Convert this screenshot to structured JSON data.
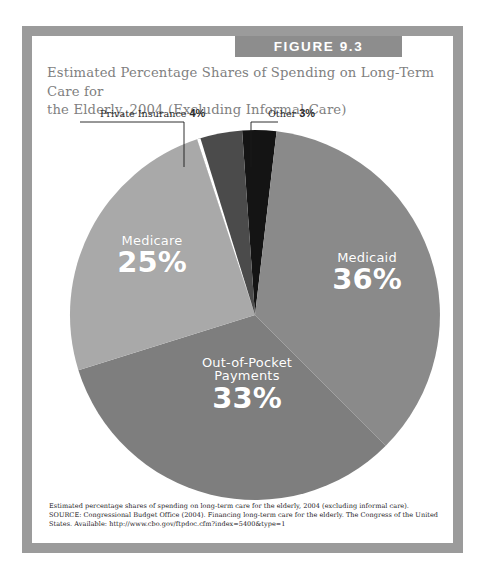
{
  "figure": {
    "banner_label": "FIGURE 9.3",
    "title_line1": "Estimated Percentage Shares of Spending on Long-Term Care for",
    "title_line2": "the Elderly, 2004 (Excluding Informal Care)",
    "caption_line1": "Estimated percentage shares of spending on long-term care for the elderly, 2004 (excluding informal care).",
    "caption_line2": "SOURCE: Congressional Budget Office (2004). Financing long-term care for the elderly. The Congress of the United",
    "caption_line3": "States. Available: http://www.cbo.gov/ftpdoc.cfm?index=5400&type=1"
  },
  "callouts": {
    "private_insurance_name": "Private Insurance",
    "private_insurance_value": "4%",
    "other_name": "Other",
    "other_value": "3%"
  },
  "slice_labels": {
    "medicaid_name": "Medicaid",
    "medicaid_value": "36%",
    "medicare_name": "Medicare",
    "medicare_value": "25%",
    "oop_name_line1": "Out-of-Pocket",
    "oop_name_line2": "Payments",
    "oop_value": "33%"
  },
  "colors": {
    "frame": "#9b9b9b",
    "banner": "#8d8d8d",
    "title_text": "#7f7f7f",
    "medicaid": "#8a8a8a",
    "out_of_pocket": "#7e7e7e",
    "medicare": "#a9a9a9",
    "private_insurance": "#4b4b4b",
    "other": "#141414",
    "label_text": "#ffffff",
    "leader_line": "#1a1a1a"
  },
  "chart_data": {
    "type": "pie",
    "title": "Estimated Percentage Shares of Spending on Long-Term Care for the Elderly, 2004 (Excluding Informal Care)",
    "xlabel": "",
    "ylabel": "",
    "legend_position": "none",
    "grid": false,
    "units": "percent",
    "total": 101,
    "start_angle_deg": -4,
    "direction": "clockwise",
    "labels": [
      "Other",
      "Medicaid",
      "Out-of-Pocket Payments",
      "Medicare",
      "Private Insurance"
    ],
    "values": [
      3,
      36,
      33,
      25,
      4
    ],
    "colors": [
      "#141414",
      "#8a8a8a",
      "#7e7e7e",
      "#a9a9a9",
      "#4b4b4b"
    ],
    "slices": [
      {
        "label": "Other",
        "value": 3,
        "display": "3%",
        "color": "#141414",
        "labeled_outside": true
      },
      {
        "label": "Medicaid",
        "value": 36,
        "display": "36%",
        "color": "#8a8a8a",
        "labeled_outside": false
      },
      {
        "label": "Out-of-Pocket Payments",
        "value": 33,
        "display": "33%",
        "color": "#7e7e7e",
        "labeled_outside": false
      },
      {
        "label": "Medicare",
        "value": 25,
        "display": "25%",
        "color": "#a9a9a9",
        "labeled_outside": false
      },
      {
        "label": "Private Insurance",
        "value": 4,
        "display": "4%",
        "color": "#4b4b4b",
        "labeled_outside": true
      }
    ]
  }
}
